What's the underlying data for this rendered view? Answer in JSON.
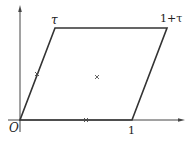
{
  "diagram": {
    "type": "fundamental-parallelogram",
    "labels": {
      "origin": "O",
      "one": "1",
      "tau": "τ",
      "one_plus_tau": "1+τ"
    },
    "vertices": {
      "origin": [
        20,
        120
      ],
      "one": [
        132,
        120
      ],
      "tau": [
        55,
        28
      ],
      "one_plus_tau": [
        167,
        28
      ]
    },
    "markers": [
      {
        "name": "half-tau-marker",
        "symbol": "×",
        "pos": [
          37,
          74
        ]
      },
      {
        "name": "center-marker",
        "symbol": "×",
        "pos": [
          97,
          77
        ]
      },
      {
        "name": "half-one-marker",
        "symbol": "×",
        "pos": [
          86,
          120
        ]
      }
    ],
    "colors": {
      "stroke": "#333333",
      "axis": "#444444"
    }
  }
}
